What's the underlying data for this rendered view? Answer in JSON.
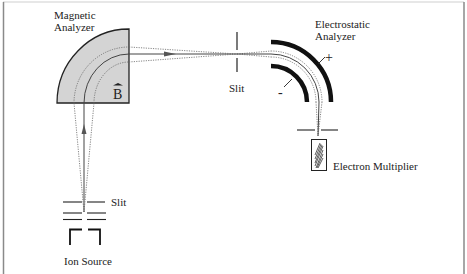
{
  "diagram": {
    "labels": {
      "magnetic_analyzer_line1": "Magnetic",
      "magnetic_analyzer_line2": "Analyzer",
      "field_symbol": "B",
      "slit_middle": "Slit",
      "electrostatic_analyzer_line1": "Electrostatic",
      "electrostatic_analyzer_line2": "Analyzer",
      "plus": "+",
      "minus": "-",
      "electron_multiplier": "Electron Multiplier",
      "slit_source": "Slit",
      "ion_source": "Ion Source"
    },
    "components": [
      "Ion Source",
      "Slit",
      "Magnetic Analyzer",
      "Slit",
      "Electrostatic Analyzer",
      "Electron Multiplier"
    ],
    "colors": {
      "magnet_fill": "#d4d4d4",
      "stroke": "#222222",
      "beam": "#555555",
      "frame": "#9a9a9a"
    }
  }
}
